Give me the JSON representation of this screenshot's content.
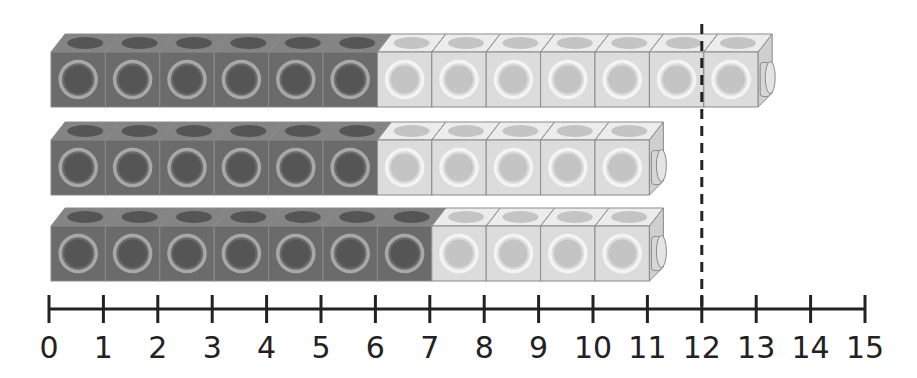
{
  "colors": {
    "dark_front": "#6b6b6b",
    "dark_top": "#848484",
    "dark_hole": "#555555",
    "dark_ring": "#a8a8a8",
    "light_front": "#dcdcdc",
    "light_top": "#ececec",
    "light_hole": "#c4c4c4",
    "light_ring": "#f4f4f4",
    "edge": "#8a8a8a",
    "axis": "#222222"
  },
  "trains": [
    {
      "name": "train-1",
      "dark": 6,
      "light": 7,
      "total": 13
    },
    {
      "name": "train-2",
      "dark": 6,
      "light": 5,
      "total": 11
    },
    {
      "name": "train-3",
      "dark": 7,
      "light": 4,
      "total": 11
    }
  ],
  "marker": {
    "value": 12,
    "style": "dashed"
  },
  "number_line": {
    "min": 0,
    "max": 15,
    "ticks": [
      "0",
      "1",
      "2",
      "3",
      "4",
      "5",
      "6",
      "7",
      "8",
      "9",
      "10",
      "11",
      "12",
      "13",
      "14",
      "15"
    ]
  }
}
